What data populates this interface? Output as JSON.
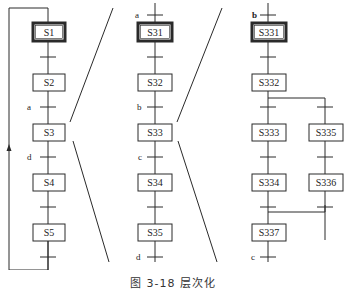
{
  "caption": "图 3-18  层次化",
  "colors": {
    "line": "#2a2a2a",
    "box_fill": "#ffffff",
    "background": "#ffffff"
  },
  "level1": {
    "steps": [
      {
        "id": "S1",
        "label": "S1",
        "initial": true
      },
      {
        "id": "S2",
        "label": "S2",
        "initial": false
      },
      {
        "id": "S3",
        "label": "S3",
        "initial": false
      },
      {
        "id": "S4",
        "label": "S4",
        "initial": false
      },
      {
        "id": "S5",
        "label": "S5",
        "initial": false
      }
    ],
    "transitions": [
      {
        "from": "S1",
        "to": "S2",
        "condition": ""
      },
      {
        "from": "S2",
        "to": "S3",
        "condition": "a"
      },
      {
        "from": "S3",
        "to": "S4",
        "condition": "d"
      },
      {
        "from": "S4",
        "to": "S5",
        "condition": ""
      },
      {
        "from": "S5",
        "to": "S1",
        "condition": ""
      }
    ]
  },
  "level2": {
    "expands": "S3",
    "entry_condition": "a",
    "exit_condition": "d",
    "steps": [
      {
        "id": "S31",
        "label": "S31",
        "initial": true
      },
      {
        "id": "S32",
        "label": "S32",
        "initial": false
      },
      {
        "id": "S33",
        "label": "S33",
        "initial": false
      },
      {
        "id": "S34",
        "label": "S34",
        "initial": false
      },
      {
        "id": "S35",
        "label": "S35",
        "initial": false
      }
    ],
    "transitions": [
      {
        "from": "S31",
        "to": "S32",
        "condition": ""
      },
      {
        "from": "S32",
        "to": "S33",
        "condition": "b"
      },
      {
        "from": "S33",
        "to": "S34",
        "condition": "c"
      },
      {
        "from": "S34",
        "to": "S35",
        "condition": ""
      }
    ]
  },
  "level3": {
    "expands": "S33",
    "entry_condition": "b",
    "exit_condition": "c",
    "steps": [
      {
        "id": "S331",
        "label": "S331",
        "initial": true
      },
      {
        "id": "S332",
        "label": "S332",
        "initial": false
      },
      {
        "id": "S333",
        "label": "S333",
        "initial": false
      },
      {
        "id": "S335",
        "label": "S335",
        "initial": false
      },
      {
        "id": "S334",
        "label": "S334",
        "initial": false
      },
      {
        "id": "S336",
        "label": "S336",
        "initial": false
      },
      {
        "id": "S337",
        "label": "S337",
        "initial": false
      }
    ],
    "branches": [
      {
        "name": "left",
        "steps": [
          "S333",
          "S334"
        ]
      },
      {
        "name": "right",
        "steps": [
          "S335",
          "S336"
        ]
      }
    ],
    "branch_from": "S332",
    "merge_to": "S337"
  },
  "labels": {
    "S1": "S1",
    "S2": "S2",
    "S3": "S3",
    "S4": "S4",
    "S5": "S5",
    "S31": "S31",
    "S32": "S32",
    "S33": "S33",
    "S34": "S34",
    "S35": "S35",
    "S331": "S331",
    "S332": "S332",
    "S333": "S333",
    "S334": "S334",
    "S335": "S335",
    "S336": "S336",
    "S337": "S337",
    "a1": "a",
    "d1": "d",
    "a2": "a",
    "b2": "b",
    "c2": "c",
    "d2": "d",
    "b3": "b",
    "c3": "c"
  }
}
